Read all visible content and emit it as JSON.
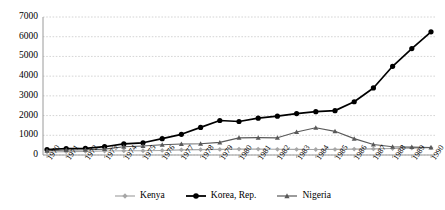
{
  "chart_data": {
    "type": "line",
    "title": "",
    "subtitle": "",
    "xlabel": "",
    "ylabel": "",
    "grid": true,
    "legend_position": "bottom",
    "ylim": [
      0,
      7000
    ],
    "ytick_step": 1000,
    "yticks": [
      "0",
      "1000",
      "2000",
      "3000",
      "4000",
      "5000",
      "6000",
      "7000"
    ],
    "categories": [
      "1970",
      "1971",
      "1972",
      "1973",
      "1974",
      "1975",
      "1976",
      "1977",
      "1978",
      "1979",
      "1980",
      "1981",
      "1982",
      "1983",
      "1984",
      "1985",
      "1986",
      "1987",
      "1988",
      "1989",
      "1990"
    ],
    "series": [
      {
        "name": "Kenya",
        "color": "#a6a6a6",
        "marker": "diamond",
        "values": [
          155,
          170,
          185,
          200,
          215,
          215,
          230,
          260,
          275,
          285,
          300,
          300,
          290,
          285,
          280,
          285,
          300,
          310,
          330,
          350,
          370
        ]
      },
      {
        "name": "Korea, Rep.",
        "color": "#000000",
        "marker": "circle",
        "values": [
          280,
          320,
          340,
          420,
          560,
          620,
          830,
          1050,
          1400,
          1750,
          1700,
          1870,
          1970,
          2100,
          2200,
          2250,
          2700,
          3400,
          4500,
          5400,
          6250
        ]
      },
      {
        "name": "Nigeria",
        "color": "#595959",
        "marker": "triangle",
        "values": [
          220,
          250,
          270,
          300,
          420,
          460,
          520,
          560,
          570,
          640,
          870,
          880,
          870,
          1170,
          1380,
          1200,
          830,
          530,
          420,
          400,
          380
        ]
      }
    ]
  }
}
